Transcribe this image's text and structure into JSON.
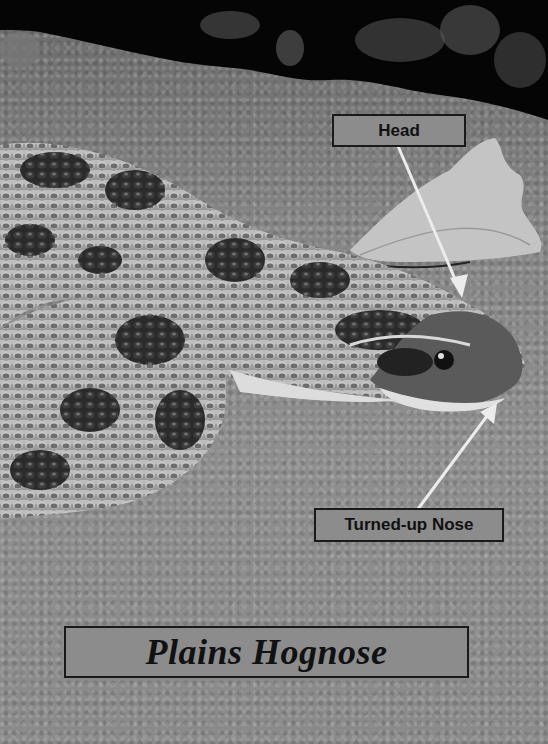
{
  "image": {
    "subject": "Plains hognose snake on sandy gravel",
    "style": "grayscale photograph with labeled callouts",
    "colors": {
      "label_fill": "#8c8c8c",
      "label_border": "#1a1a1a",
      "label_text": "#111111",
      "arrow": "#e8e8e8",
      "background_top": "#0a0a0a",
      "ground": "#8a8a8a"
    }
  },
  "labels": {
    "head": "Head",
    "nose": "Turned-up Nose",
    "title": "Plains Hognose"
  }
}
